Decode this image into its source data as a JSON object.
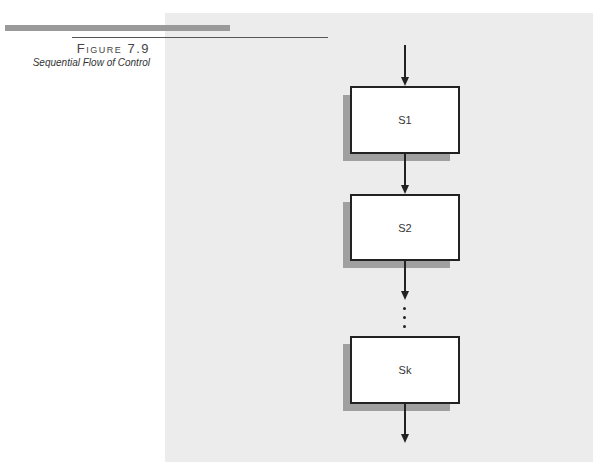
{
  "figure": {
    "number": "Figure 7.9",
    "caption": "Sequential Flow of Control"
  },
  "diagram": {
    "type": "flowchart",
    "nodes": [
      {
        "id": "S1",
        "label": "S1"
      },
      {
        "id": "S2",
        "label": "S2"
      },
      {
        "id": "Sk",
        "label": "Sk"
      }
    ],
    "ellipsis": "⋮",
    "edges": [
      {
        "from": "entry",
        "to": "S1"
      },
      {
        "from": "S1",
        "to": "S2"
      },
      {
        "from": "S2",
        "to": "ellipsis"
      },
      {
        "from": "ellipsis",
        "to": "Sk"
      },
      {
        "from": "Sk",
        "to": "exit"
      }
    ]
  },
  "colors": {
    "panel": "#ececec",
    "shadow": "#a0a0a0",
    "box_border": "#222222",
    "header_bar": "#9a9a9a"
  }
}
